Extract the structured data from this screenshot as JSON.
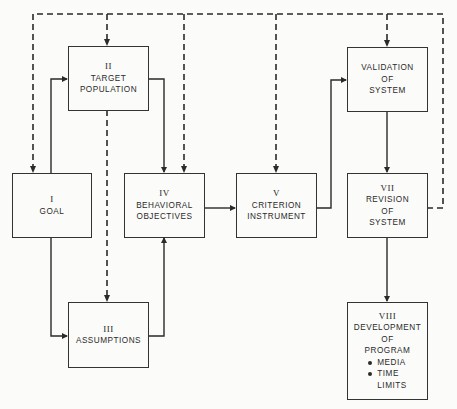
{
  "diagram": {
    "type": "flowchart",
    "nodes": [
      {
        "id": "goal",
        "number": "I",
        "lines": [
          "GOAL"
        ]
      },
      {
        "id": "target",
        "number": "II",
        "lines": [
          "TARGET",
          "POPULATION"
        ]
      },
      {
        "id": "assumptions",
        "number": "III",
        "lines": [
          "ASSUMPTIONS"
        ]
      },
      {
        "id": "objectives",
        "number": "IV",
        "lines": [
          "BEHAVIORAL",
          "OBJECTIVES"
        ]
      },
      {
        "id": "criterion",
        "number": "V",
        "lines": [
          "CRITERION",
          "INSTRUMENT"
        ]
      },
      {
        "id": "validation",
        "number": "",
        "lines": [
          "VALIDATION",
          "OF",
          "SYSTEM"
        ]
      },
      {
        "id": "revision",
        "number": "VII",
        "lines": [
          "REVISION",
          "OF",
          "SYSTEM"
        ]
      },
      {
        "id": "development",
        "number": "VIII",
        "lines": [
          "DEVELOPMENT",
          "OF",
          "PROGRAM"
        ],
        "bullets": [
          "MEDIA",
          "TIME LIMITS"
        ]
      }
    ],
    "edges_solid": [
      [
        "goal",
        "target"
      ],
      [
        "goal",
        "assumptions"
      ],
      [
        "target",
        "objectives"
      ],
      [
        "assumptions",
        "objectives"
      ],
      [
        "objectives",
        "criterion"
      ],
      [
        "criterion",
        "validation"
      ],
      [
        "validation",
        "revision"
      ],
      [
        "revision",
        "development"
      ]
    ],
    "edges_dashed_feedback_from_revision": [
      "goal",
      "target",
      "objectives",
      "criterion",
      "validation"
    ],
    "edges_dashed": [
      [
        "target",
        "assumptions"
      ]
    ]
  },
  "labels": {
    "goal_num": "I",
    "goal_1": "GOAL",
    "target_num": "II",
    "target_1": "TARGET",
    "target_2": "POPULATION",
    "assump_num": "III",
    "assump_1": "ASSUMPTIONS",
    "obj_num": "IV",
    "obj_1": "BEHAVIORAL",
    "obj_2": "OBJECTIVES",
    "crit_num": "V",
    "crit_1": "CRITERION",
    "crit_2": "INSTRUMENT",
    "val_1": "VALIDATION",
    "val_2": "OF",
    "val_3": "SYSTEM",
    "rev_num": "VII",
    "rev_1": "REVISION",
    "rev_2": "OF",
    "rev_3": "SYSTEM",
    "dev_num": "VIII",
    "dev_1": "DEVELOPMENT",
    "dev_2": "OF",
    "dev_3": "PROGRAM",
    "dev_b1": "MEDIA",
    "dev_b2a": "TIME",
    "dev_b2b": "LIMITS"
  },
  "colors": {
    "line": "#2a2a2a",
    "background": "#fbfbf9"
  }
}
